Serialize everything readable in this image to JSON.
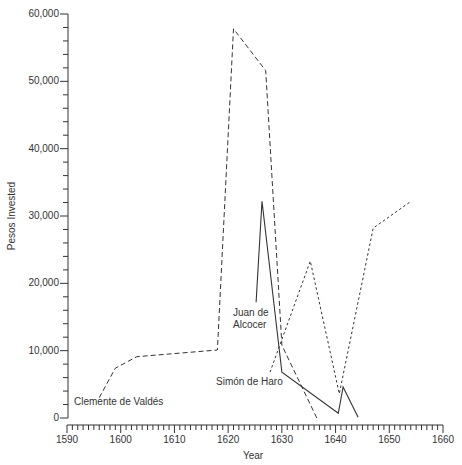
{
  "chart_data": {
    "type": "line",
    "title": "",
    "xlabel": "Year",
    "ylabel": "Pesos Invested",
    "xlim": [
      1590,
      1660
    ],
    "ylim": [
      0,
      60000
    ],
    "x_ticks": [
      1590,
      1600,
      1610,
      1620,
      1630,
      1640,
      1650,
      1660
    ],
    "x_tick_labels": [
      "1590",
      "1600",
      "1610",
      "1620",
      "1630",
      "1640",
      "1650",
      "1660"
    ],
    "y_ticks": [
      0,
      10000,
      20000,
      30000,
      40000,
      50000,
      60000
    ],
    "y_tick_labels": [
      "0",
      "10,000",
      "20,000",
      "30,000",
      "40,000",
      "50,000",
      "60,000"
    ],
    "x_minor_step": 1,
    "y_minor_step": 2000,
    "grid": false,
    "legend": "none (series labeled by annotations)",
    "series": [
      {
        "name": "Clemente de Valdés",
        "style": "long-dash",
        "points": [
          [
            1596,
            3000
          ],
          [
            1599,
            7400
          ],
          [
            1603,
            9100
          ],
          [
            1618,
            10100
          ],
          [
            1621,
            57800
          ],
          [
            1627,
            51600
          ],
          [
            1630,
            10800
          ],
          [
            1636.5,
            0
          ]
        ]
      },
      {
        "name": "Juan de Alcocer",
        "style": "solid",
        "points": [
          [
            1625.2,
            17200
          ],
          [
            1626.3,
            32200
          ],
          [
            1630,
            6800
          ],
          [
            1640.5,
            700
          ],
          [
            1641.4,
            4600
          ],
          [
            1644.2,
            100
          ]
        ]
      },
      {
        "name": "Simón de Haro",
        "style": "short-dash",
        "points": [
          [
            1627.8,
            6800
          ],
          [
            1635.3,
            23300
          ],
          [
            1640.7,
            3600
          ],
          [
            1647,
            28200
          ],
          [
            1653.9,
            32100
          ]
        ]
      }
    ],
    "annotations": [
      {
        "text": "Clemente de Valdés",
        "anchor": "series-start",
        "lines": [
          "Clemente de Valdés"
        ]
      },
      {
        "text": "Juan de Alcocer",
        "anchor": "series-start",
        "lines": [
          "Juan de",
          "Alcocer"
        ]
      },
      {
        "text": "Simón de Haro",
        "anchor": "series-start",
        "lines": [
          "Simón de Haro"
        ]
      }
    ]
  },
  "labels": {
    "x_axis_title": "Year",
    "y_axis_title": "Pesos Invested",
    "clemente": "Clemente de Valdés",
    "juan_line1": "Juan de",
    "juan_line2": "Alcocer",
    "simon": "Simón de Haro"
  }
}
